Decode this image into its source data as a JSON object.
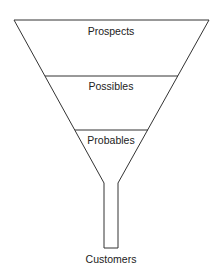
{
  "diagram": {
    "type": "sales-funnel",
    "stages": [
      {
        "label": "Prospects"
      },
      {
        "label": "Possibles"
      },
      {
        "label": "Probables"
      }
    ],
    "output_label": "Customers",
    "colors": {
      "line": "#333333",
      "text": "#222222",
      "background": "#ffffff"
    }
  }
}
